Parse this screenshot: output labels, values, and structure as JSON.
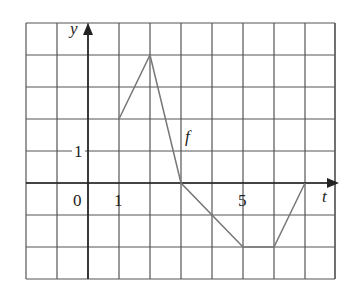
{
  "chart_data": {
    "type": "line",
    "title": "",
    "xlabel": "t",
    "ylabel": "y",
    "function_label": "f",
    "x": [
      1,
      2,
      3,
      5,
      6,
      7
    ],
    "series": [
      {
        "name": "f",
        "values": [
          2,
          4,
          0,
          -2,
          -2,
          0
        ]
      }
    ],
    "xlim": [
      -2,
      8
    ],
    "ylim": [
      -3,
      5
    ],
    "grid": true,
    "tick_labels": {
      "x": [
        "0",
        "1",
        "5"
      ],
      "y": [
        "1"
      ]
    }
  },
  "labels": {
    "y_axis": "y",
    "x_axis": "t",
    "f": "f",
    "origin": "0",
    "x_one": "1",
    "x_five": "5",
    "y_one": "1"
  },
  "colors": {
    "grid": "#555555",
    "curve": "#777777",
    "axis": "#222222"
  }
}
